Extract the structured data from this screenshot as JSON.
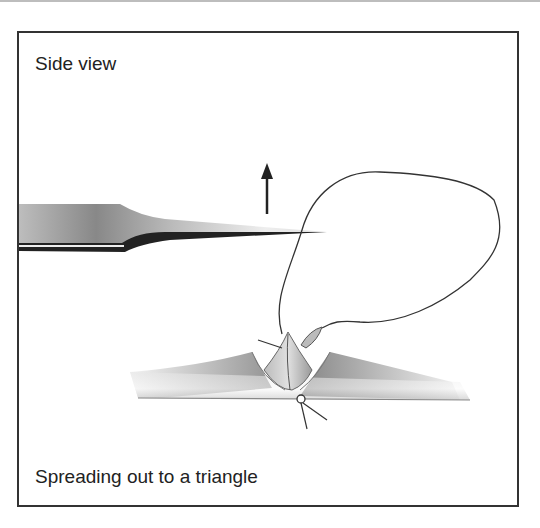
{
  "figure": {
    "title": "Side view",
    "caption": "Spreading out to a triangle"
  },
  "illustration": {
    "elements": [
      "forceps",
      "upward-arrow",
      "suture-loop",
      "tissue-triangle",
      "tissue-surface",
      "suture-knot"
    ],
    "arrow_direction": "up"
  }
}
